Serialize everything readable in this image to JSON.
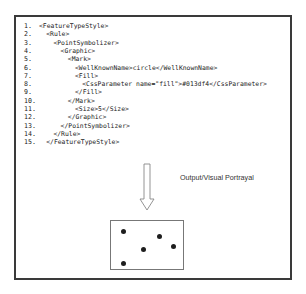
{
  "code_listing": [
    {
      "num": "1.",
      "indent": 0,
      "text": "<FeatureTypeStyle>"
    },
    {
      "num": "2.",
      "indent": 1,
      "text": "<Rule>"
    },
    {
      "num": "3.",
      "indent": 2,
      "text": "<PointSymbolizer>"
    },
    {
      "num": "4.",
      "indent": 3,
      "text": "<Graphic>"
    },
    {
      "num": "5.",
      "indent": 4,
      "text": "<Mark>"
    },
    {
      "num": "6.",
      "indent": 5,
      "text": "<WellKnownName>circle</WellKnownName>"
    },
    {
      "num": "7.",
      "indent": 5,
      "text": "<Fill>"
    },
    {
      "num": "8.",
      "indent": 6,
      "text": "<CssParameter name=\"fill\">#013df4</CssParameter>"
    },
    {
      "num": "9.",
      "indent": 5,
      "text": "</Fill>"
    },
    {
      "num": "10.",
      "indent": 4,
      "text": "</Mark>"
    },
    {
      "num": "11.",
      "indent": 5,
      "text": "<Size>5</Size>"
    },
    {
      "num": "12.",
      "indent": 4,
      "text": "</Graphic>"
    },
    {
      "num": "13.",
      "indent": 3,
      "text": "</PointSymbolizer>"
    },
    {
      "num": "14.",
      "indent": 2,
      "text": "</Rule>"
    },
    {
      "num": "15.",
      "indent": 1,
      "text": "</FeatureTypeStyle>"
    }
  ],
  "caption": "Output/Visual Portrayal",
  "portrayal": {
    "points": [
      {
        "x": 12,
        "y": 10
      },
      {
        "x": 48,
        "y": 15
      },
      {
        "x": 32,
        "y": 28
      },
      {
        "x": 62,
        "y": 25
      },
      {
        "x": 12,
        "y": 42
      }
    ]
  },
  "colors": {
    "border": "#3a3a3a",
    "dot": "#1e1e1e",
    "fill_param": "#013df4"
  }
}
